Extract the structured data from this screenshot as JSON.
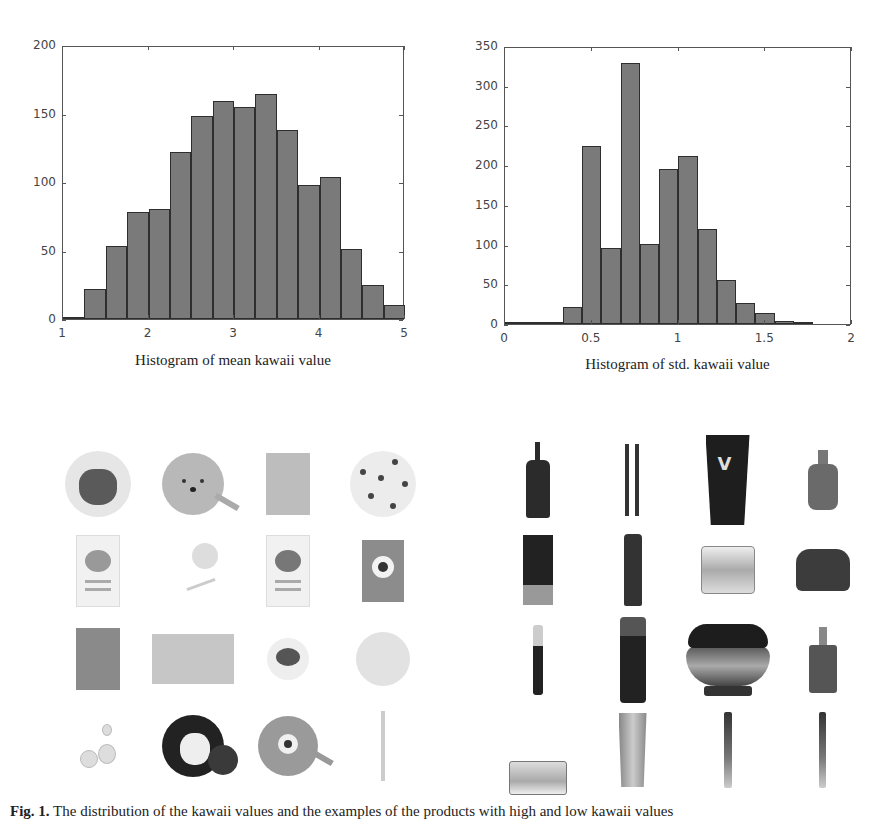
{
  "chart_data": [
    {
      "type": "bar",
      "subtype": "histogram",
      "title": "Histogram of mean kawaii value",
      "xlabel": "",
      "ylabel": "",
      "bin_edges": [
        1.0,
        1.25,
        1.5,
        1.75,
        2.0,
        2.25,
        2.5,
        2.75,
        3.0,
        3.25,
        3.5,
        3.75,
        4.0,
        4.25,
        4.5,
        4.75,
        5.0
      ],
      "values": [
        1,
        22,
        53,
        78,
        80,
        122,
        148,
        159,
        155,
        164,
        138,
        98,
        104,
        51,
        25,
        10
      ],
      "xlim": [
        1,
        5
      ],
      "ylim": [
        0,
        200
      ],
      "xticks": [
        "1",
        "2",
        "3",
        "4",
        "5"
      ],
      "yticks": [
        "0",
        "50",
        "100",
        "150",
        "200"
      ],
      "grid": false,
      "legend": null,
      "bar_color": "#7a7a7a"
    },
    {
      "type": "bar",
      "subtype": "histogram",
      "title": "Histogram of  std. kawaii value",
      "xlabel": "",
      "ylabel": "",
      "bin_edges": [
        0.0,
        0.111,
        0.222,
        0.333,
        0.444,
        0.555,
        0.666,
        0.777,
        0.888,
        0.999,
        1.11,
        1.221,
        1.332,
        1.443,
        1.554,
        1.665,
        1.776
      ],
      "values": [
        3,
        0,
        0,
        22,
        224,
        96,
        329,
        101,
        195,
        212,
        120,
        55,
        27,
        14,
        4,
        1
      ],
      "xlim": [
        0,
        2
      ],
      "ylim": [
        0,
        350
      ],
      "xticks": [
        "0",
        "0.5",
        "1",
        "1.5",
        "2"
      ],
      "yticks": [
        "0",
        "50",
        "100",
        "150",
        "200",
        "250",
        "300",
        "350"
      ],
      "grid": false,
      "legend": null,
      "bar_color": "#7a7a7a"
    }
  ],
  "charts": {
    "left": {
      "caption": "Histogram of mean kawaii value",
      "yticks": [
        "0",
        "50",
        "100",
        "150",
        "200"
      ],
      "xticks": [
        "1",
        "2",
        "3",
        "4",
        "5"
      ]
    },
    "right": {
      "caption": "Histogram of  std. kawaii value",
      "yticks": [
        "0",
        "50",
        "100",
        "150",
        "200",
        "250",
        "300",
        "350"
      ],
      "xticks": [
        "0",
        "0.5",
        "1",
        "1.5",
        "2"
      ]
    }
  },
  "image_grids": {
    "left": {
      "description": "Products with high kawaii value",
      "items": [
        "round cushion compact with cat face (BOSO CAT)",
        "round Winnie-the-Pooh face compact with puff",
        "sheet mask pack",
        "round patterned compact (BOSO CAT)",
        "sheet mask pack with character face",
        "character accessory set",
        "sheet mask pack with bear character",
        "one-eyed monster mask pack",
        "Winnie-the-Pooh illustrated pack",
        "character palette card",
        "small round compact with lid",
        "floral round compact",
        "duck character figurines",
        "Mickey Mouse compact",
        "one-eyed round compact with puff",
        "thin character stick"
      ]
    },
    "right": {
      "description": "Products with low kawaii value",
      "items": [
        "dark pump bottle",
        "pair of eyeliner pencils",
        "dark squeeze tube (V logo)",
        "serum bottle with dropper",
        "slim dark cosmetic bottle",
        "dark spray bottle",
        "gold cream jar",
        "dark cream jar",
        "mascara",
        "dark essence bottle",
        "ornate dark cream jar",
        "ampoule bottle",
        "clear cream jar",
        "gold tube",
        "slim stick",
        "slim stick"
      ]
    }
  },
  "figure": {
    "label": "Fig. 1.",
    "caption_visible": "The distribution of the kawaii values and the examples of the products with high and low kawaii values"
  }
}
